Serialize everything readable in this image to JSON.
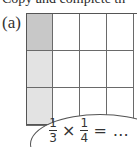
{
  "instruction": "Copy and complete th",
  "part_label": "(a)",
  "grid": {
    "rows": 3,
    "cols": 4,
    "cell_width": 27,
    "cell_height": 37.5,
    "shaded_column": 0,
    "shade_dark_rows": [
      0
    ],
    "colors": {
      "dark": "#c8c8c8",
      "light": "#e3e3e3",
      "blank": "#ffffff",
      "lines": "#6a6a6a"
    }
  },
  "expression": {
    "frac1": {
      "num": "1",
      "den": "3"
    },
    "operator": "×",
    "frac2": {
      "num": "1",
      "den": "4"
    },
    "equals": "=",
    "result": "…"
  }
}
